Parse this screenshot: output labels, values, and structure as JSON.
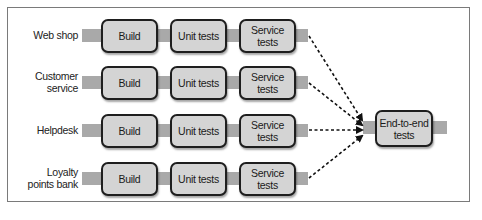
{
  "diagram": {
    "rows": [
      {
        "label": "Web shop",
        "stages": [
          "Build",
          "Unit tests",
          "Service tests"
        ]
      },
      {
        "label": "Customer service",
        "stages": [
          "Build",
          "Unit tests",
          "Service tests"
        ]
      },
      {
        "label": "Helpdesk",
        "stages": [
          "Build",
          "Unit tests",
          "Service tests"
        ]
      },
      {
        "label": "Loyalty points bank",
        "stages": [
          "Build",
          "Unit tests",
          "Service tests"
        ]
      }
    ],
    "rowLabels": {
      "r0": "Web shop",
      "r1a": "Customer",
      "r1b": "service",
      "r2": "Helpdesk",
      "r3a": "Loyalty",
      "r3b": "points bank"
    },
    "stageLabels": {
      "build": "Build",
      "unit": "Unit tests",
      "service": "Service tests"
    },
    "target": {
      "line1": "End-to-end",
      "line2": "tests"
    },
    "colors": {
      "box_fill": "#d4d4d4",
      "box_border": "#1e1e1e",
      "bar": "#a9a9a9",
      "arrow": "#111111",
      "frame": "#7a7a7a"
    }
  }
}
